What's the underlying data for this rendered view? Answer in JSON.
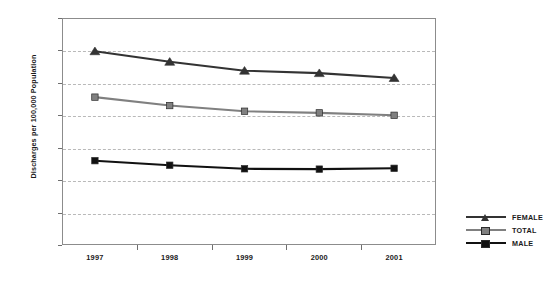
{
  "chart_data": {
    "type": "line",
    "title": "",
    "xlabel": "",
    "ylabel": "Discharges per 100,000 Population",
    "categories": [
      "1997",
      "1998",
      "1999",
      "2000",
      "2001"
    ],
    "ylim": [
      0,
      1400
    ],
    "yticks": [
      0,
      200,
      400,
      600,
      800,
      1000,
      1200,
      1400
    ],
    "ytick_labels": [
      "0",
      "200",
      "400",
      "600",
      "800",
      "1,000",
      "1,200",
      "1,400"
    ],
    "grid": true,
    "legend_position": "right",
    "series": [
      {
        "name": "FEMALE",
        "color": "#333333",
        "marker": "triangle",
        "values": [
          1195,
          1130,
          1075,
          1060,
          1030
        ]
      },
      {
        "name": "TOTAL",
        "color": "#808080",
        "marker": "square",
        "values": [
          912,
          860,
          825,
          815,
          800
        ]
      },
      {
        "name": "MALE",
        "color": "#111111",
        "marker": "square",
        "values": [
          520,
          492,
          470,
          468,
          473
        ]
      }
    ]
  },
  "legend": {
    "items": [
      {
        "label": "FEMALE"
      },
      {
        "label": "TOTAL"
      },
      {
        "label": "MALE"
      }
    ]
  }
}
